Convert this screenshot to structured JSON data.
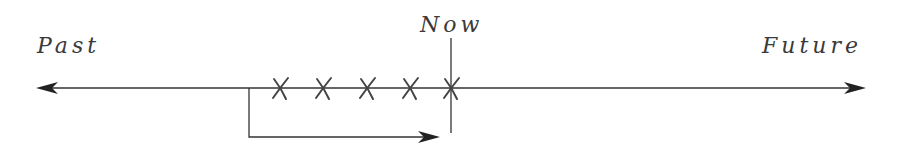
{
  "diagram": {
    "type": "timeline",
    "labels": {
      "past": "Past",
      "now": "Now",
      "future": "Future"
    },
    "markers": {
      "symbol": "X",
      "count": 5,
      "positions_x": [
        280,
        323,
        367,
        410,
        452
      ]
    },
    "colors": {
      "line": "#333333",
      "text": "#3a3a3a",
      "background": "#ffffff"
    }
  }
}
